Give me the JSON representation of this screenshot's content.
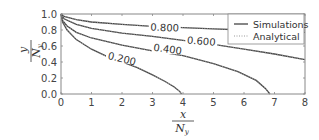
{
  "chart_data": {
    "type": "line",
    "title": "",
    "xlabel": "x / N_y",
    "ylabel": "y / N_y",
    "xlim": [
      0,
      8
    ],
    "ylim": [
      0,
      1.0
    ],
    "grid": false,
    "legend_position": "upper right",
    "x_ticks": [
      "0",
      "1",
      "2",
      "3",
      "4",
      "5",
      "6",
      "7",
      "8"
    ],
    "y_ticks": [
      "0.0",
      "0.2",
      "0.4",
      "0.6",
      "0.8",
      "1.0"
    ],
    "legend": [
      {
        "label": "Simulations",
        "style": "solid",
        "color": "#444444"
      },
      {
        "label": "Analytical",
        "style": "dotted",
        "color": "#999999"
      }
    ],
    "series": [
      {
        "name": "0.200",
        "label_pos": [
          2.0,
          0.44
        ],
        "x": [
          0,
          0.05,
          0.2,
          0.5,
          1.0,
          1.5,
          2.0,
          2.5,
          3.0,
          3.4,
          3.7,
          3.9,
          3.95
        ],
        "y": [
          1.0,
          0.9,
          0.8,
          0.68,
          0.56,
          0.47,
          0.4,
          0.33,
          0.24,
          0.16,
          0.09,
          0.03,
          0.0
        ]
      },
      {
        "name": "0.400",
        "label_pos": [
          3.5,
          0.56
        ],
        "x": [
          0,
          0.05,
          0.2,
          0.5,
          1.0,
          2.0,
          3.0,
          4.0,
          5.0,
          5.8,
          6.4,
          6.7,
          6.85
        ],
        "y": [
          1.0,
          0.92,
          0.85,
          0.77,
          0.7,
          0.61,
          0.54,
          0.48,
          0.38,
          0.28,
          0.17,
          0.07,
          0.0
        ]
      },
      {
        "name": "0.600",
        "label_pos": [
          4.6,
          0.66
        ],
        "x": [
          0,
          0.1,
          0.5,
          1.0,
          2.0,
          3.0,
          4.0,
          5.0,
          6.0,
          7.0,
          8.0
        ],
        "y": [
          1.0,
          0.94,
          0.87,
          0.82,
          0.76,
          0.72,
          0.67,
          0.62,
          0.56,
          0.5,
          0.43
        ]
      },
      {
        "name": "0.800",
        "label_pos": [
          3.4,
          0.83
        ],
        "x": [
          0,
          0.1,
          0.5,
          1.0,
          2.0,
          3.0,
          4.0,
          5.0,
          6.0,
          7.0,
          8.0
        ],
        "y": [
          1.0,
          0.97,
          0.93,
          0.9,
          0.87,
          0.845,
          0.83,
          0.815,
          0.8,
          0.785,
          0.77
        ]
      }
    ]
  }
}
